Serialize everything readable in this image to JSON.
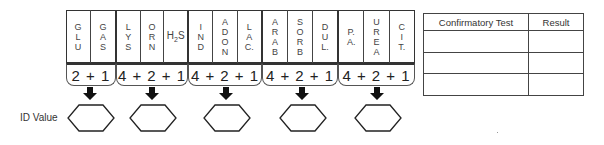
{
  "groups": [
    {
      "tests": [
        "GLU",
        "GAS"
      ],
      "score": "2+1"
    },
    {
      "tests": [
        "LYS",
        "ORN",
        "H2S"
      ],
      "score": "4+2+1"
    },
    {
      "tests": [
        "IND",
        "ADON",
        "LAC"
      ],
      "score": "4+2+1"
    },
    {
      "tests": [
        "ARAB",
        "SORB",
        "DUL"
      ],
      "score": "4+2+1"
    },
    {
      "tests": [
        "P.A.",
        "UREA",
        "CIT."
      ],
      "score": "4+2+1"
    }
  ],
  "labels": {
    "glu": [
      "G",
      "L",
      "U"
    ],
    "gas": [
      "G",
      "A",
      "S"
    ],
    "lys": [
      "L",
      "Y",
      "S"
    ],
    "orn": [
      "O",
      "R",
      "N"
    ],
    "h2s_main": "H",
    "h2s_sub": "2",
    "h2s_end": "S",
    "ind": [
      "I",
      "N",
      "D"
    ],
    "adon": [
      "A",
      "D",
      "O",
      "N"
    ],
    "lac": [
      "L",
      "A",
      "C."
    ],
    "arab": [
      "A",
      "R",
      "A",
      "B"
    ],
    "sorb": [
      "S",
      "O",
      "R",
      "B"
    ],
    "dul": [
      "D",
      "U",
      "L."
    ],
    "pa": [
      "P.",
      "A."
    ],
    "urea": [
      "U",
      "R",
      "E",
      "A"
    ],
    "cit": [
      "C",
      "I",
      "T."
    ]
  },
  "scores": [
    "2 + 1",
    "4 + 2 + 1",
    "4 + 2 + 1",
    "4 + 2 + 1",
    "4 + 2 + 1"
  ],
  "id_value_label": "ID Value",
  "confirmatory_table": {
    "headers": [
      "Confirmatory Test",
      "Result"
    ],
    "rows": [
      [
        "",
        ""
      ],
      [
        "",
        ""
      ],
      [
        "",
        ""
      ]
    ]
  }
}
